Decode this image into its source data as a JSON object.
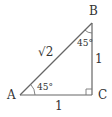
{
  "diagram": {
    "type": "right-triangle",
    "vertices": {
      "A": {
        "label": "A"
      },
      "B": {
        "label": "B"
      },
      "C": {
        "label": "C"
      }
    },
    "sides": {
      "hypotenuse_AB": "√2",
      "vertical_BC": "1",
      "horizontal_AC": "1"
    },
    "angles": {
      "angle_A": "45°",
      "angle_B": "45°",
      "angle_C": "right-angle"
    },
    "colors": {
      "line": "#555555",
      "text": "#333333"
    }
  }
}
